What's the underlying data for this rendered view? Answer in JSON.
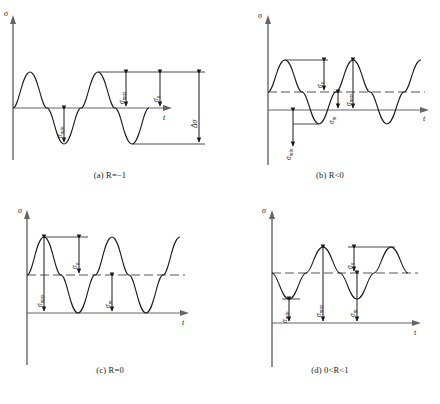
{
  "figure": {
    "axis_labels": {
      "y": "σ",
      "x": "t"
    },
    "symbols": {
      "sigma_max": "σmax",
      "sigma_min": "σmin",
      "sigma_a": "σa",
      "sigma_m": "σm",
      "delta_sigma": "Δσ"
    },
    "colors": {
      "curve": "#1a1a1a",
      "axis": "#555555",
      "dashed": "#555555",
      "text": "#1a1a1a"
    },
    "panels": [
      {
        "id": "a",
        "caption_prefix": "(a)",
        "caption_value": "R=−1",
        "caption": "(a)  R=−1",
        "y_axis_label": "σ",
        "x_axis_label": "t",
        "mean_line": "none",
        "annotations": [
          {
            "name": "sigma-min",
            "label": "σmin"
          },
          {
            "name": "sigma-max",
            "label": "σmax"
          },
          {
            "name": "sigma-a",
            "label": "σa"
          },
          {
            "name": "delta-sigma",
            "label": "Δσ"
          }
        ]
      },
      {
        "id": "b",
        "caption_prefix": "(b)",
        "caption_value": "R<0",
        "caption": "(b)  R<0",
        "y_axis_label": "σ",
        "x_axis_label": "t",
        "mean_line": "dashed",
        "annotations": [
          {
            "name": "sigma-a",
            "label": "σa"
          },
          {
            "name": "sigma-max",
            "label": "σmax"
          },
          {
            "name": "sigma-m",
            "label": "σm"
          },
          {
            "name": "sigma-min",
            "label": "σmin"
          }
        ]
      },
      {
        "id": "c",
        "caption_prefix": "(c)",
        "caption_value": "R=0",
        "caption": "(c)  R=0",
        "y_axis_label": "σ",
        "x_axis_label": "t",
        "mean_line": "dashed",
        "annotations": [
          {
            "name": "sigma-max",
            "label": "σmax"
          },
          {
            "name": "sigma-a",
            "label": "σa"
          },
          {
            "name": "sigma-m",
            "label": "σm"
          }
        ]
      },
      {
        "id": "d",
        "caption_prefix": "(d)",
        "caption_value": "0<R<1",
        "caption": "(d)  0<R<1",
        "y_axis_label": "σ",
        "x_axis_label": "t",
        "mean_line": "dashed",
        "annotations": [
          {
            "name": "sigma-min",
            "label": "σmin"
          },
          {
            "name": "sigma-max",
            "label": "σmax"
          },
          {
            "name": "sigma-a",
            "label": "σa"
          },
          {
            "name": "sigma-m",
            "label": "σm"
          }
        ]
      }
    ]
  },
  "chart_data": {
    "type": "line",
    "xlabel": "t",
    "ylabel": "σ",
    "grid": false,
    "legend": "none",
    "subplots": [
      {
        "id": "a",
        "caption": "(a)  R=−1",
        "R": -1,
        "mean_stress": 0,
        "amplitude": 1,
        "sigma_max": 1,
        "sigma_min": -1,
        "delta_sigma": 2,
        "cycles": 2,
        "x": [
          0,
          0.25,
          0.5,
          0.75,
          1,
          1.25,
          1.5,
          1.75,
          2
        ],
        "y": [
          0,
          1,
          0,
          -1,
          0,
          1,
          0,
          -1,
          0
        ]
      },
      {
        "id": "b",
        "caption": "(b)  R<0",
        "R": -0.33,
        "mean_stress": 0.33,
        "amplitude": 1,
        "sigma_max": 1.33,
        "sigma_min": -0.67,
        "cycles": 2.25,
        "x": [
          0,
          0.25,
          0.5,
          0.75,
          1,
          1.25,
          1.5,
          1.75,
          2,
          2.25
        ],
        "y": [
          0.33,
          1.33,
          0.33,
          -0.67,
          0.33,
          1.33,
          0.33,
          -0.67,
          0.33,
          1.33
        ]
      },
      {
        "id": "c",
        "caption": "(c)  R=0",
        "R": 0,
        "mean_stress": 1,
        "amplitude": 1,
        "sigma_max": 2,
        "sigma_min": 0,
        "cycles": 2.25,
        "x": [
          0,
          0.25,
          0.5,
          0.75,
          1,
          1.25,
          1.5,
          1.75,
          2,
          2.25
        ],
        "y": [
          1,
          2,
          1,
          0,
          1,
          2,
          1,
          0,
          1,
          2
        ]
      },
      {
        "id": "d",
        "caption": "(d)  0<R<1",
        "R": 0.33,
        "mean_stress": 1,
        "amplitude": 0.67,
        "sigma_max": 1.67,
        "sigma_min": 0.33,
        "cycles": 2.25,
        "x": [
          0,
          0.25,
          0.5,
          0.75,
          1,
          1.25,
          1.5,
          1.75,
          2,
          2.25
        ],
        "y": [
          1,
          0.33,
          1,
          1.67,
          1,
          0.33,
          1,
          1.67,
          1,
          0.33
        ]
      }
    ]
  }
}
